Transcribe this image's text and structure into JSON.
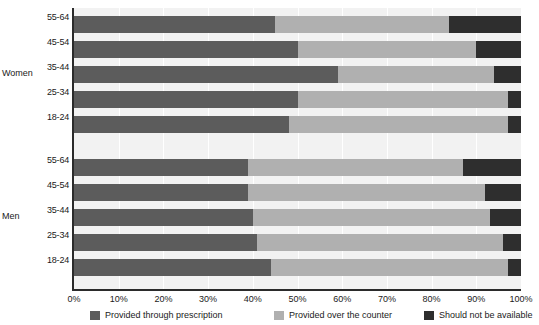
{
  "chart_data": {
    "type": "bar",
    "orientation": "horizontal",
    "stacked": true,
    "stack_mode": "percent",
    "title": "",
    "xlabel": "",
    "ylabel": "",
    "xlim": [
      0,
      100
    ],
    "grid": true,
    "legend_position": "bottom",
    "x_ticks": [
      "0%",
      "10%",
      "20%",
      "30%",
      "40%",
      "50%",
      "60%",
      "70%",
      "80%",
      "90%",
      "100%"
    ],
    "x_tick_values": [
      0,
      10,
      20,
      30,
      40,
      50,
      60,
      70,
      80,
      90,
      100
    ],
    "groups": [
      "Women",
      "Men"
    ],
    "categories": [
      "55-64",
      "45-54",
      "35-44",
      "25-34",
      "18-24",
      "55-64",
      "45-54",
      "35-44",
      "25-34",
      "18-24"
    ],
    "series": [
      {
        "name": "Provided through prescription",
        "color": "#5c5c5c",
        "values": [
          45,
          50,
          59,
          50,
          48,
          39,
          39,
          40,
          41,
          44
        ]
      },
      {
        "name": "Provided over the counter",
        "color": "#b0b0b0",
        "values": [
          39,
          40,
          35,
          47,
          49,
          48,
          53,
          53,
          55,
          53
        ]
      },
      {
        "name": "Should  not be available",
        "color": "#2e2e2e",
        "values": [
          16,
          10,
          6,
          3,
          3,
          13,
          8,
          7,
          4,
          3
        ]
      }
    ],
    "bars": [
      {
        "group": "Women",
        "age": "55-64",
        "prescription": 45,
        "counter": 39,
        "unavailable": 16
      },
      {
        "group": "Women",
        "age": "45-54",
        "prescription": 50,
        "counter": 40,
        "unavailable": 10
      },
      {
        "group": "Women",
        "age": "35-44",
        "prescription": 59,
        "counter": 35,
        "unavailable": 6
      },
      {
        "group": "Women",
        "age": "25-34",
        "prescription": 50,
        "counter": 47,
        "unavailable": 3
      },
      {
        "group": "Women",
        "age": "18-24",
        "prescription": 48,
        "counter": 49,
        "unavailable": 3
      },
      {
        "group": "Men",
        "age": "55-64",
        "prescription": 39,
        "counter": 48,
        "unavailable": 13
      },
      {
        "group": "Men",
        "age": "45-54",
        "prescription": 39,
        "counter": 53,
        "unavailable": 8
      },
      {
        "group": "Men",
        "age": "35-44",
        "prescription": 40,
        "counter": 53,
        "unavailable": 7
      },
      {
        "group": "Men",
        "age": "25-34",
        "prescription": 41,
        "counter": 55,
        "unavailable": 4
      },
      {
        "group": "Men",
        "age": "18-24",
        "prescription": 44,
        "counter": 53,
        "unavailable": 3
      }
    ]
  },
  "legend": {
    "items": [
      {
        "label": "Provided through prescription",
        "color": "#5c5c5c",
        "swatch_name": "legend-swatch-prescription"
      },
      {
        "label": "Provided over the counter",
        "color": "#b0b0b0",
        "swatch_name": "legend-swatch-counter"
      },
      {
        "label": "Should  not be available",
        "color": "#2e2e2e",
        "swatch_name": "legend-swatch-unavailable"
      }
    ]
  },
  "axis": {
    "group_labels": [
      {
        "text": "Women",
        "top": 68
      },
      {
        "text": "Men",
        "top": 211
      }
    ]
  },
  "colors": {
    "plot_background": "#f2f2f2",
    "gridline": "#ffffff",
    "axis": "#2b2b2b",
    "text": "#1a1a1a"
  }
}
